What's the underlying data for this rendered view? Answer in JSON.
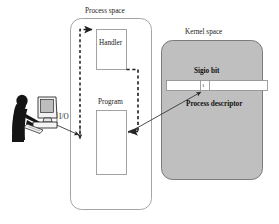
{
  "figure": {
    "title_labels": {
      "process_space": "Process space",
      "kernel_space": "Kernel space"
    },
    "boxes": {
      "handler": "Handler",
      "program": "Program"
    },
    "kernel": {
      "sigio_bit_label": "Sigio bit",
      "process_descriptor_label": "Process descriptor",
      "bit_value": "1"
    },
    "actor": {
      "io_label": "I/O",
      "icon": "user-at-computer-icon"
    },
    "arrows": [
      {
        "name": "io-to-program",
        "style": "solid",
        "from": "user-computer",
        "to": "process-space-dashed-path",
        "label": "I/O"
      },
      {
        "name": "sigio-bit-to-program",
        "style": "solid",
        "from": "program-box",
        "to": "sigio-bit-cell"
      },
      {
        "name": "program-to-handler",
        "style": "dashed",
        "from": "program-box",
        "to": "handler-box"
      }
    ],
    "colors": {
      "kernel_fill": "#bfbfbf",
      "kernel_stroke": "#6f6f6f",
      "process_stroke": "#9a9a9a",
      "box_stroke": "#9a9a9a",
      "bar_fill": "#ffffff",
      "arrow_stroke": "#333333",
      "text": "#1a1a1a",
      "silhouette": "#151515"
    }
  }
}
